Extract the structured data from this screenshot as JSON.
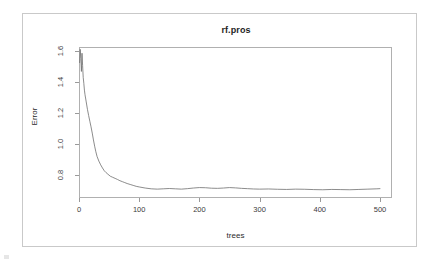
{
  "figure": {
    "device_background": "#ffffff",
    "frame_color": "#c9c9c9",
    "panel_border_color": "#b0b0b0",
    "line_color": "#6f6f6f"
  },
  "chart_data": {
    "type": "line",
    "title": "rf.pros",
    "xlabel": "trees",
    "ylabel": "Error",
    "grid": false,
    "legend": null,
    "xlim": [
      0,
      520
    ],
    "ylim": [
      0.655,
      1.625
    ],
    "xticks": [
      0,
      100,
      200,
      300,
      400,
      500
    ],
    "xtick_labels": [
      "0",
      "100",
      "200",
      "300",
      "400",
      "500"
    ],
    "yticks": [
      0.8,
      1.0,
      1.2,
      1.4,
      1.6
    ],
    "ytick_labels": [
      "0.8",
      "1.0",
      "1.2",
      "1.4",
      "1.6"
    ],
    "series": [
      {
        "name": "OOB error",
        "color": "#6f6f6f",
        "x": [
          1,
          2,
          3,
          4,
          5,
          6,
          7,
          8,
          9,
          10,
          12,
          14,
          16,
          18,
          20,
          22,
          24,
          26,
          28,
          30,
          33,
          36,
          39,
          42,
          45,
          48,
          52,
          56,
          60,
          64,
          68,
          72,
          76,
          80,
          85,
          90,
          95,
          100,
          110,
          120,
          130,
          140,
          150,
          160,
          170,
          180,
          190,
          200,
          210,
          220,
          230,
          240,
          250,
          260,
          270,
          280,
          290,
          300,
          315,
          330,
          345,
          360,
          375,
          390,
          405,
          420,
          435,
          450,
          465,
          480,
          495,
          500
        ],
        "y": [
          1.525,
          1.61,
          1.552,
          1.468,
          1.585,
          1.505,
          1.43,
          1.392,
          1.348,
          1.318,
          1.272,
          1.225,
          1.185,
          1.148,
          1.112,
          1.072,
          1.028,
          0.988,
          0.952,
          0.922,
          0.892,
          0.868,
          0.848,
          0.83,
          0.818,
          0.808,
          0.795,
          0.788,
          0.781,
          0.774,
          0.766,
          0.76,
          0.754,
          0.748,
          0.742,
          0.736,
          0.73,
          0.726,
          0.719,
          0.714,
          0.712,
          0.714,
          0.716,
          0.714,
          0.712,
          0.715,
          0.719,
          0.722,
          0.721,
          0.718,
          0.717,
          0.719,
          0.722,
          0.72,
          0.717,
          0.715,
          0.713,
          0.712,
          0.713,
          0.711,
          0.71,
          0.712,
          0.711,
          0.709,
          0.708,
          0.71,
          0.709,
          0.708,
          0.71,
          0.712,
          0.714,
          0.715
        ]
      }
    ]
  }
}
